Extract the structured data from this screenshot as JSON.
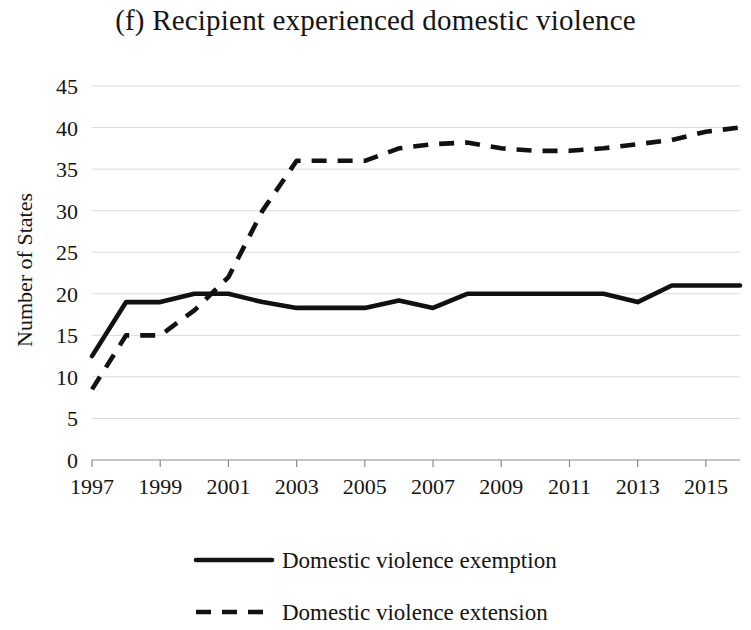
{
  "figure": {
    "title": "(f) Recipient experienced domestic violence",
    "panel_label": "(f)"
  },
  "axes": {
    "y_axis_title": "Number of States",
    "y_ticks": [
      "0",
      "5",
      "10",
      "15",
      "20",
      "25",
      "30",
      "35",
      "40",
      "45"
    ],
    "x_ticks": [
      "1997",
      "1999",
      "2001",
      "2003",
      "2005",
      "2007",
      "2009",
      "2011",
      "2013",
      "2015"
    ]
  },
  "legend": {
    "items": [
      {
        "label": "Domestic violence exemption",
        "style": "solid",
        "color": "#111111"
      },
      {
        "label": "Domestic violence extension",
        "style": "dashed",
        "color": "#111111"
      }
    ]
  },
  "chart_data": {
    "type": "line",
    "title": "(f) Recipient experienced domestic violence",
    "xlabel": "",
    "ylabel": "Number of States",
    "xlim": [
      1997,
      2016
    ],
    "ylim": [
      0,
      45
    ],
    "ytick_step": 5,
    "xtick_step": 2,
    "grid": true,
    "legend_position": "bottom",
    "x": [
      1997,
      1998,
      1999,
      2000,
      2001,
      2002,
      2003,
      2004,
      2005,
      2006,
      2007,
      2008,
      2009,
      2010,
      2011,
      2012,
      2013,
      2014,
      2015,
      2016
    ],
    "series": [
      {
        "name": "Domestic violence exemption",
        "style": "solid",
        "color": "#111111",
        "values": [
          12.5,
          19,
          19,
          20,
          20,
          19,
          18.3,
          18.3,
          18.3,
          19.2,
          18.3,
          20,
          20,
          20,
          20,
          20,
          19,
          21,
          21,
          21
        ]
      },
      {
        "name": "Domestic violence extension",
        "style": "dashed",
        "color": "#111111",
        "values": [
          8.5,
          15,
          15,
          18,
          22,
          30,
          36,
          36,
          36,
          37.5,
          38,
          38.2,
          37.5,
          37.2,
          37.2,
          37.5,
          38,
          38.5,
          39.5,
          40
        ]
      }
    ]
  }
}
